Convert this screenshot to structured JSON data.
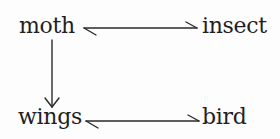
{
  "nodes": {
    "moth": "moth",
    "insect": "insect",
    "wings": "wings",
    "bird": "bird"
  },
  "edges": [
    {
      "from": "moth",
      "to": "insect",
      "type": "bidirectional-harpoon"
    },
    {
      "from": "moth",
      "to": "wings",
      "type": "arrow"
    },
    {
      "from": "wings",
      "to": "bird",
      "type": "bidirectional-harpoon"
    }
  ],
  "colors": {
    "ink": "#1f1f1f",
    "background": "#fdfdfd"
  }
}
